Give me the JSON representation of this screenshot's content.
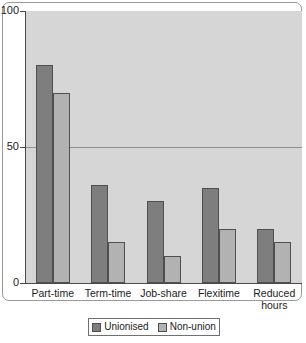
{
  "chart_data": {
    "type": "bar",
    "title": "",
    "subtitle": "",
    "xlabel": "",
    "ylabel": "",
    "ylim": [
      0,
      100
    ],
    "yticks": [
      "0",
      "50",
      "100"
    ],
    "ytick_values": [
      0,
      50,
      100
    ],
    "grid": "horizontal-at-50",
    "legend_position": "bottom-center",
    "categories": [
      "Part-time",
      "Term-time",
      "Job-share",
      "Flexitime",
      "Reduced\nhours"
    ],
    "series": [
      {
        "name": "Unionised",
        "color": "#7e7e7e",
        "values": [
          80,
          36,
          30,
          35,
          20
        ]
      },
      {
        "name": "Non-union",
        "color": "#b2b2b2",
        "values": [
          70,
          15,
          10,
          20,
          15
        ]
      }
    ]
  },
  "colors": {
    "plot_background": "#d6d6d6",
    "page_background": "#ffffff",
    "axis": "#4a4a4a",
    "gridline": "#8e8e8e",
    "bar_border": "#4f4f4f",
    "text": "#1b1b1b",
    "frame_border": "#9a9a9a"
  }
}
